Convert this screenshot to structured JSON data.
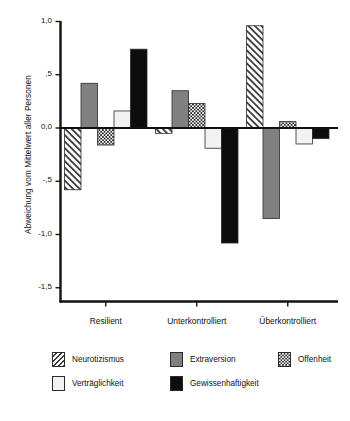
{
  "chart_data": {
    "type": "bar",
    "title": "",
    "subtitle": "",
    "xlabel": "",
    "ylabel": "Abweichung vom Mittelwert aller Personen",
    "categories": [
      "Resilient",
      "Unterkontrolliert",
      "Überkontrolliert"
    ],
    "series": [
      {
        "name": "Neurotizismus",
        "values": [
          -0.58,
          -0.05,
          0.96
        ],
        "pattern": "diagonal-hatch",
        "color": "#ffffff"
      },
      {
        "name": "Extraversion",
        "values": [
          0.42,
          0.35,
          -0.85
        ],
        "pattern": "solid-gray",
        "color": "#808080"
      },
      {
        "name": "Offenheit",
        "values": [
          -0.16,
          0.23,
          0.06
        ],
        "pattern": "checkerboard",
        "color": "#2b2b2b"
      },
      {
        "name": "Verträglichkeit",
        "values": [
          0.16,
          -0.19,
          -0.15
        ],
        "pattern": "solid-white",
        "color": "#f2f2f2"
      },
      {
        "name": "Gewissenhaftigkeit",
        "values": [
          0.74,
          -1.08,
          -0.1
        ],
        "pattern": "solid-black",
        "color": "#0d0d0d"
      }
    ],
    "ylim": [
      -1.65,
      1.12
    ],
    "yticks": [
      1.0,
      0.5,
      0.0,
      -0.5,
      -1.0,
      -1.5
    ],
    "ytick_labels": [
      "1,0",
      ",5",
      "0,0",
      "-,5",
      "-1,0",
      "-1,5"
    ],
    "grid": false,
    "legend_position": "bottom",
    "zero_line": true
  },
  "axis": {
    "y_title": "Abweichung vom Mittelwert aller Personen"
  },
  "legend": {
    "items": [
      {
        "label": "Neurotizismus"
      },
      {
        "label": "Extraversion"
      },
      {
        "label": "Offenheit"
      },
      {
        "label": "Verträglichkeit"
      },
      {
        "label": "Gewissenhaftigkeit"
      }
    ]
  }
}
